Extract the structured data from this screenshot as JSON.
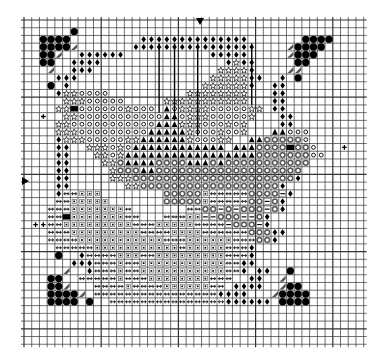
{
  "pattern": {
    "title": "Cross-stitch fish pattern chart",
    "grid": {
      "cols": 44,
      "rows": 42,
      "cell": 7.72,
      "origin_x": 24,
      "origin_y": 20,
      "line_color": "#333333",
      "major_every": 10
    },
    "center_markers": {
      "top_col": 22,
      "left_row": 21
    },
    "legend_symbols": {
      "O": "filled-circle",
      "d": "diamond-dot",
      "s": "open-star",
      "c": "open-circle",
      "t": "filled-triangle",
      "r": "ring-circle",
      "q": "square-dot",
      "a": "double-arrow",
      "m": "minus-box",
      "h": "half-stitch",
      "b": "black-square",
      "+": "plus-cross",
      ".": "small-dot"
    },
    "rows": [
      "............................................",
      "......O.....................................",
      "..OOOO.........dddddddddddddd.......OOOO....",
      "..OOOOh.......dddddddddddddddd....hOOOO.....",
      "..OOh..dddddd...........ddddd.....hOOO......",
      "..OO..dddd................dsdd.....OO.......",
      "...h..ddd................ssssd....hh........",
      "....ddd.................sssssdd..d.O........",
      "...O.d.................ssssssd..dd..........",
      "....dsscccc..........ssssssss...dd..........",
      ".....sssccccc.....sssssssssss...dd..........",
      "....ssbccccccsccc.tcsssscccccss.dd..........",
      "..+..sscccccccccccttcssscccccs...dd.........",
      "....ssccccccccccctttssscccscs....dd.........",
      "....sssccccccccctttttscccsccs...ttccc.......",
      "....dssscccccssttttttscccss..ttrrrrrc.......",
      "....dd..ssscsctttttttttttt.tttrrrrbrrc...+..",
      "....dd...sscstttttttttttttttttrrrrrrrcc.....",
      "....dd....ssrttttrrrrtttrtrrrrrrrrrrr.......",
      "....dd.....srrrttrrrrrrrrrrrrrrrrrrr........",
      "....dd.....sssrrrrrrrrrrrrrrrrrrrrrd........",
      "....dd.......ssrrrrrrrrrrrrrrrrrrd..........",
      "....daaqqq........rrrrrqaaaaarrrrmd.........",
      "....aaqqqqq.......rrrrrqaaaaarrmrd..........",
      "...aaaqqqqqqqa.......aarrmrmrrrmrd..........",
      "...aabqqqqqqqaa...aaaqqmmrrrmmrd............",
      ".++aaqqqqqqqqqaaaqqqqqaaaamrrrmd............",
      "...aaaqqqqqqqqqaaaaqqqqaaaaaarrrdd..........",
      "...aaaaqqqqqqqqqqqaaaqqqqqqaaarrd...........",
      "....aaaaaqqqqqqqqqqqaqqqqqaaad..............",
      "....O..daaaaqqqaaqqqqqqqqqaaad..............",
      "......dddaaaqaaqqqqqqqqqqqaadd..............",
      ".....h..daaaqaaqqqqqqqqqqqaad.dd..O.........",
      "...OO..aaaaaqaaaqqqqqqqqaaa..dd..h.........",
      "...OOh...aaaaqaaaaqqqqqqaa.dddd..hOO........",
      "...OOOOh.aaaaaaaaaaaaaaaadddd...hOOOO.......",
      "...OOOO.O..aaaaaaaaaaaaaaadddddd.OOOO.......",
      "............................................",
      "............................................",
      "............................................",
      "............................................",
      "............................................"
    ]
  }
}
